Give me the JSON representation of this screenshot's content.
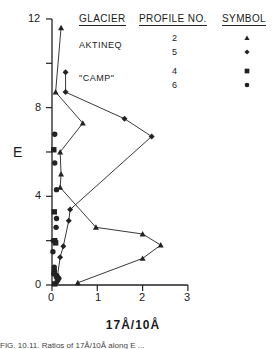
{
  "chart_data": {
    "type": "line",
    "title": "",
    "xlabel": "17Å/10Å",
    "ylabel": "E",
    "xlim": [
      0,
      3
    ],
    "ylim": [
      0,
      12
    ],
    "xticks": [
      "0",
      "1",
      "2",
      "3"
    ],
    "yticks": [
      "0",
      "4",
      "8",
      "12"
    ],
    "grid": false,
    "legend": {
      "position": "top-right",
      "headers": [
        "GLACIER",
        "PROFILE NO.",
        "SYMBOL"
      ],
      "groups": [
        {
          "glacier": "AKTINEQ",
          "rows": [
            {
              "profile": "2",
              "symbol": "triangle"
            },
            {
              "profile": "5",
              "symbol": "diamond"
            }
          ]
        },
        {
          "glacier": "\"CAMP\"",
          "rows": [
            {
              "profile": "4",
              "symbol": "square"
            },
            {
              "profile": "6",
              "symbol": "circle"
            }
          ]
        }
      ]
    },
    "series": [
      {
        "name": "Profile 2",
        "glacier": "AKTINEQ",
        "symbol": "triangle",
        "connected": true,
        "points": [
          [
            0.2,
            11.6
          ],
          [
            0.08,
            8.7
          ],
          [
            0.68,
            7.3
          ],
          [
            0.18,
            6.0
          ],
          [
            0.2,
            5.0
          ],
          [
            0.18,
            4.4
          ],
          [
            0.97,
            2.6
          ],
          [
            2.0,
            2.3
          ],
          [
            2.4,
            1.8
          ],
          [
            2.0,
            1.2
          ],
          [
            0.57,
            0.1
          ]
        ]
      },
      {
        "name": "Profile 5",
        "glacier": "AKTINEQ",
        "symbol": "diamond",
        "connected": true,
        "points": [
          [
            0.3,
            9.6
          ],
          [
            0.3,
            8.7
          ],
          [
            1.6,
            7.5
          ],
          [
            2.2,
            6.7
          ],
          [
            0.4,
            3.4
          ],
          [
            0.37,
            2.9
          ],
          [
            0.25,
            1.75
          ],
          [
            0.18,
            1.25
          ],
          [
            0.12,
            0.4
          ],
          [
            0.1,
            0.1
          ]
        ]
      },
      {
        "name": "Profile 4",
        "glacier": "\"CAMP\"",
        "symbol": "square",
        "connected": false,
        "points": [
          [
            0.04,
            6.1
          ],
          [
            0.05,
            3.3
          ],
          [
            0.06,
            2.0
          ],
          [
            0.08,
            1.9
          ],
          [
            0.05,
            0.6
          ],
          [
            0.1,
            0.4
          ],
          [
            0.12,
            0.25
          ],
          [
            0.06,
            0.05
          ]
        ]
      },
      {
        "name": "Profile 6",
        "glacier": "\"CAMP\"",
        "symbol": "circle",
        "connected": false,
        "points": [
          [
            0.06,
            6.8
          ],
          [
            0.06,
            5.5
          ],
          [
            0.1,
            4.3
          ],
          [
            0.1,
            3.0
          ],
          [
            0.09,
            2.6
          ],
          [
            0.02,
            1.5
          ],
          [
            0.03,
            2.0
          ],
          [
            0.05,
            0.8
          ],
          [
            0.04,
            0.5
          ],
          [
            0.15,
            0.3
          ]
        ]
      }
    ]
  },
  "labels": {
    "y_axis": "E",
    "x_axis": "17Å/10Å",
    "legend_header_glacier": "GLACIER",
    "legend_header_profile": "PROFILE NO.",
    "legend_header_symbol": "SYMBOL",
    "glacier_1": "AKTINEQ",
    "glacier_2": "\"CAMP\"",
    "profile_2": "2",
    "profile_5": "5",
    "profile_4": "4",
    "profile_6": "6",
    "caption_partial": "FIG. 10.11. Ratios of 17Å/10Å along E ..."
  }
}
